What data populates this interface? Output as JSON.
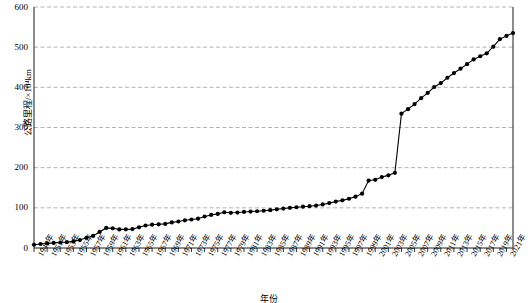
{
  "chart_data": {
    "type": "line",
    "title": "",
    "xlabel": "年份",
    "ylabel": "公路里程/×10⁴km",
    "ylim": [
      0,
      600
    ],
    "ytick_values": [
      0,
      100,
      200,
      300,
      400,
      500,
      600
    ],
    "ytick_labels": [
      "0",
      "100",
      "200",
      "300",
      "400",
      "500",
      "600"
    ],
    "grid": "horizontal-dashed",
    "legend": "none",
    "marker": "filled-circle",
    "line_color": "#000000",
    "grid_color": "#9aa0b0",
    "frame_color": "#000000",
    "xtick_labels": [
      "1949年",
      "1951年",
      "1953年",
      "1955年",
      "1957年",
      "1959年",
      "1961年",
      "1963年",
      "1965年",
      "1967年",
      "1969年",
      "1971年",
      "1973年",
      "1975年",
      "1977年",
      "1979年",
      "1981年",
      "1983年",
      "1985年",
      "1987年",
      "1989年",
      "1991年",
      "1993年",
      "1995年",
      "1997年",
      "1999年",
      "2001年",
      "2003年",
      "2005年",
      "2007年",
      "2009年",
      "2011年",
      "2013年",
      "2015年",
      "2017年",
      "2019年",
      "2021年"
    ],
    "xtick_step_years": 2,
    "x": [
      1949,
      1950,
      1951,
      1952,
      1953,
      1954,
      1955,
      1956,
      1957,
      1958,
      1959,
      1960,
      1961,
      1962,
      1963,
      1964,
      1965,
      1966,
      1967,
      1968,
      1969,
      1970,
      1971,
      1972,
      1973,
      1974,
      1975,
      1976,
      1977,
      1978,
      1979,
      1980,
      1981,
      1982,
      1983,
      1984,
      1985,
      1986,
      1987,
      1988,
      1989,
      1990,
      1991,
      1992,
      1993,
      1994,
      1995,
      1996,
      1997,
      1998,
      1999,
      2000,
      2001,
      2002,
      2003,
      2004,
      2005,
      2006,
      2007,
      2008,
      2009,
      2010,
      2011,
      2012,
      2013,
      2014,
      2015,
      2016,
      2017,
      2018,
      2019,
      2020,
      2021,
      2022
    ],
    "values": [
      8.1,
      9.9,
      11.4,
      12.7,
      13.7,
      14.6,
      16.4,
      19.7,
      25.5,
      30.0,
      40.0,
      50.0,
      49.0,
      46.3,
      46.4,
      47.0,
      51.5,
      56.0,
      58.0,
      59.0,
      60.0,
      63.7,
      66.0,
      69.0,
      71.0,
      73.0,
      78.4,
      82.3,
      84.9,
      89.0,
      87.6,
      88.3,
      89.8,
      90.7,
      91.5,
      92.7,
      94.2,
      96.3,
      98.2,
      99.9,
      101.4,
      102.8,
      104.1,
      105.7,
      108.4,
      111.8,
      115.7,
      118.6,
      122.6,
      127.9,
      135.2,
      167.9,
      169.8,
      176.5,
      180.9,
      187.1,
      334.5,
      345.7,
      358.4,
      373.0,
      386.1,
      400.8,
      410.6,
      423.8,
      435.6,
      446.4,
      457.7,
      469.6,
      477.4,
      484.7,
      501.3,
      519.8,
      528.1,
      535.0
    ],
    "series_name": "公路里程",
    "notes": {
      "unit": "×10⁴km",
      "x_first": 1949,
      "x_last": 2022
    }
  }
}
